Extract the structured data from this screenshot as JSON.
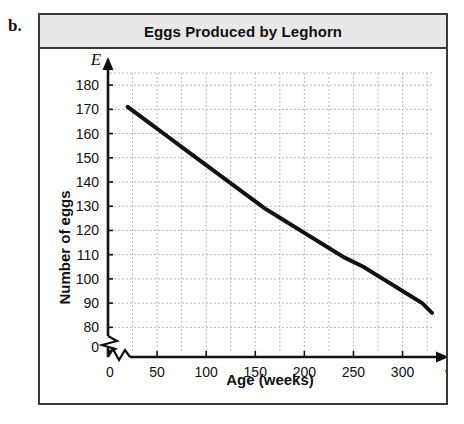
{
  "item_label": "b.",
  "panel": {
    "title": "Eggs Produced by Leghorn"
  },
  "chart_data": {
    "type": "line",
    "title": "Eggs Produced by Leghorn",
    "xlabel": "Age (weeks)",
    "ylabel": "Number of eggs",
    "x_axis_variable": "w",
    "y_axis_variable": "E",
    "xlim": [
      0,
      330
    ],
    "ylim": [
      80,
      185
    ],
    "y_axis_break": true,
    "x_axis_break": true,
    "grid": true,
    "grid_style": "dashed",
    "legend": "none",
    "xticks": [
      0,
      50,
      100,
      150,
      200,
      250,
      300
    ],
    "xtick_labels": [
      "0",
      "50",
      "100",
      "150",
      "200",
      "250",
      "300"
    ],
    "x_gridlines": [
      25,
      50,
      75,
      100,
      125,
      150,
      175,
      200,
      225,
      250,
      275,
      300,
      325
    ],
    "yticks": [
      0,
      80,
      90,
      100,
      110,
      120,
      130,
      140,
      150,
      160,
      170,
      180
    ],
    "ytick_labels": [
      "0",
      "80",
      "90",
      "100",
      "110",
      "120",
      "130",
      "140",
      "150",
      "160",
      "170",
      "180"
    ],
    "series": [
      {
        "name": "Eggs produced",
        "x": [
          20,
          40,
          60,
          80,
          100,
          120,
          140,
          160,
          180,
          200,
          220,
          240,
          260,
          280,
          300,
          320,
          330
        ],
        "values": [
          171,
          165,
          159,
          153,
          147,
          141,
          135,
          129,
          124,
          119,
          114,
          109,
          105,
          100,
          95,
          90,
          86
        ]
      }
    ],
    "annotations": [
      "Curve decreases from about 171 eggs at 20 weeks to about 86 eggs at 330 weeks",
      "Exponential decay shape, concave up"
    ],
    "colors": {
      "curve": "#111111",
      "grid": "#b9b9c6",
      "axis": "#111111",
      "title_band": "#e8e8e8",
      "panel_border": "#3a3a3a"
    }
  },
  "axis_tick_text": {
    "y": [
      "180",
      "170",
      "160",
      "150",
      "140",
      "130",
      "120",
      "110",
      "100",
      "90",
      "80",
      "0"
    ],
    "x": [
      "0",
      "50",
      "100",
      "150",
      "200",
      "250",
      "300"
    ]
  }
}
